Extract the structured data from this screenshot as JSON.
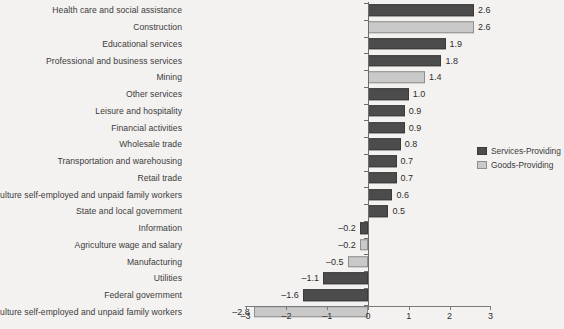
{
  "chart_data": {
    "type": "bar",
    "orientation": "horizontal",
    "title": "",
    "xlabel": "",
    "ylabel": "",
    "xlim": [
      -3,
      3
    ],
    "xticks": [
      "–3",
      "–2",
      "–1",
      "0",
      "1",
      "2",
      "3"
    ],
    "xtick_values": [
      -3,
      -2,
      -1,
      0,
      1,
      2,
      3
    ],
    "grid": false,
    "legend_position": "right",
    "categories": [
      "Health care and social assistance",
      "Construction",
      "Educational services",
      "Professional and business services",
      "Mining",
      "Other services",
      "Leisure and hospitality",
      "Financial activities",
      "Wholesale trade",
      "Transportation and warehousing",
      "Retail trade",
      "Nonagriculture self-employed and unpaid family workers",
      "State and local government",
      "Information",
      "Agriculture wage and salary",
      "Manufacturing",
      "Utilities",
      "Federal government",
      "Agriculture self-employed and unpaid family workers"
    ],
    "values": [
      2.6,
      2.6,
      1.9,
      1.8,
      1.4,
      1.0,
      0.9,
      0.9,
      0.8,
      0.7,
      0.7,
      0.6,
      0.5,
      -0.2,
      -0.2,
      -0.5,
      -1.1,
      -1.6,
      -2.8
    ],
    "value_labels": [
      "2.6",
      "2.6",
      "1.9",
      "1.8",
      "1.4",
      "1.0",
      "0.9",
      "0.9",
      "0.8",
      "0.7",
      "0.7",
      "0.6",
      "0.5",
      "–0.2",
      "–0.2",
      "–0.5",
      "–1.1",
      "–1.6",
      "–2.8"
    ],
    "series_of": [
      "services",
      "goods",
      "services",
      "services",
      "goods",
      "services",
      "services",
      "services",
      "services",
      "services",
      "services",
      "services",
      "services",
      "services",
      "goods",
      "goods",
      "services",
      "services",
      "goods"
    ],
    "series": [
      {
        "name": "Services-Providing",
        "color": "#4c4c4c"
      },
      {
        "name": "Goods-Providing",
        "color": "#c9c9c9"
      }
    ]
  },
  "legend": {
    "items": [
      {
        "label": "Services-Providing",
        "key": "services"
      },
      {
        "label": "Goods-Providing",
        "key": "goods"
      }
    ]
  }
}
